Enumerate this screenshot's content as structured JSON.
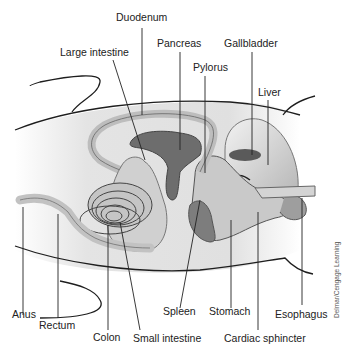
{
  "diagram": {
    "credit": "Delmar/Cengage Learning",
    "labels": {
      "duodenum": "Duodenum",
      "large_intestine": "Large intestine",
      "pancreas": "Pancreas",
      "gallbladder": "Gallbladder",
      "pylorus": "Pylorus",
      "liver": "Liver",
      "anus": "Anus",
      "rectum": "Rectum",
      "colon": "Colon",
      "small_intestine": "Small intestine",
      "spleen": "Spleen",
      "stomach": "Stomach",
      "cardiac_sphincter": "Cardiac sphincter",
      "esophagus": "Esophagus"
    },
    "colors": {
      "outline": "#222222",
      "body_fill": "#e6e6e6",
      "organ_light": "#c8c8c8",
      "organ_mid": "#a8a8a8",
      "organ_dark": "#6e6e6e"
    }
  }
}
